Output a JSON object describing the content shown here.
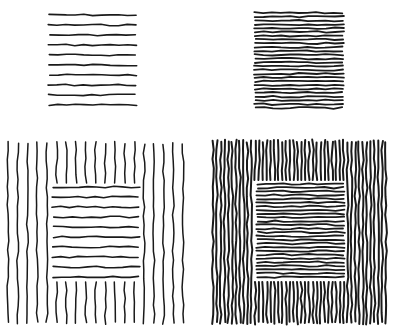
{
  "figure": {
    "background": "#ffffff",
    "ink": "#1a1a1a",
    "panels": [
      {
        "id": "sparse-horizontal",
        "x": 49,
        "y": 15,
        "w": 87,
        "h": 90,
        "orientation": "horizontal",
        "lines": 10,
        "stroke": 1.6
      },
      {
        "id": "dense-horizontal",
        "x": 255,
        "y": 13,
        "w": 88,
        "h": 95,
        "orientation": "horizontal",
        "lines": 26,
        "stroke": 1.8
      },
      {
        "id": "sparse-vertical-surround",
        "x": 8,
        "y": 143,
        "w": 175,
        "h": 180,
        "orientation": "vertical",
        "lines": 19,
        "stroke": 1.5,
        "inset": {
          "x": 53,
          "y": 187,
          "w": 86,
          "h": 90,
          "orientation": "horizontal",
          "lines": 10,
          "stroke": 1.6
        }
      },
      {
        "id": "dense-vertical-surround",
        "x": 213,
        "y": 141,
        "w": 173,
        "h": 182,
        "orientation": "vertical",
        "lines": 46,
        "stroke": 2.0,
        "inset": {
          "x": 257,
          "y": 184,
          "w": 87,
          "h": 93,
          "orientation": "horizontal",
          "lines": 26,
          "stroke": 1.8
        }
      }
    ]
  }
}
